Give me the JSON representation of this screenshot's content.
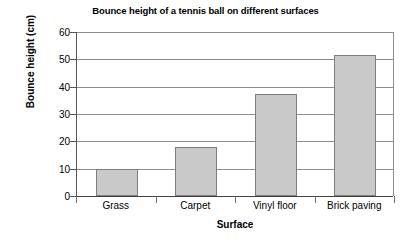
{
  "chart_data": {
    "type": "bar",
    "title": "Bounce height of a tennis ball on different surfaces",
    "xlabel": "Surface",
    "ylabel": "Bounce height (cm)",
    "categories": [
      "Grass",
      "Carpet",
      "Vinyl floor",
      "Brick paving"
    ],
    "values": [
      10,
      18,
      37.5,
      51.5
    ],
    "ylim": [
      0,
      60
    ],
    "yticks": [
      0,
      10,
      20,
      30,
      40,
      50,
      60
    ],
    "ytick_labels": [
      "0",
      "10",
      "20",
      "30",
      "40",
      "50",
      "60"
    ],
    "grid": true,
    "legend": false,
    "bar_color": "#c9c9c9",
    "bar_border_color": "#7d7d7d",
    "axis_color": "#555555",
    "grid_color": "#8d8d8d"
  }
}
